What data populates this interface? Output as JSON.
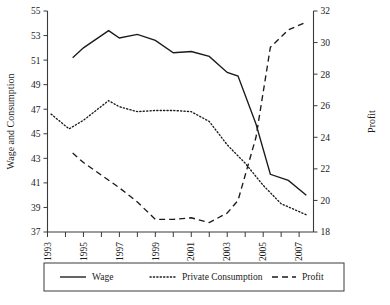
{
  "chart_data": {
    "type": "line",
    "title": "",
    "xlabel": "",
    "ylabel": "Wage and Consumption",
    "y2label": "Profit",
    "grid": false,
    "legend_position": "bottom",
    "x": [
      1993,
      1994,
      1995,
      1996,
      1997,
      1998,
      1999,
      2000,
      2001,
      2002,
      2003,
      2004,
      2005,
      2006,
      2007
    ],
    "xtick_labels": [
      "1993",
      "1995",
      "1997",
      "1999",
      "2001",
      "2003",
      "2005",
      "2007"
    ],
    "xtick_values": [
      1993,
      1995,
      1997,
      1999,
      2001,
      2003,
      2005,
      2007
    ],
    "xlim": [
      1993,
      2007.8
    ],
    "ylim": [
      37,
      55
    ],
    "ytick_values": [
      37,
      39,
      41,
      43,
      45,
      47,
      49,
      51,
      53,
      55
    ],
    "ytick_labels": [
      "37",
      "39",
      "41",
      "43",
      "45",
      "47",
      "49",
      "51",
      "53",
      "55"
    ],
    "y2lim": [
      18,
      32
    ],
    "y2tick_values": [
      18,
      20,
      22,
      24,
      26,
      28,
      30,
      32
    ],
    "y2tick_labels": [
      "18",
      "20",
      "22",
      "24",
      "26",
      "28",
      "30",
      "32"
    ],
    "series": [
      {
        "name": "Wage",
        "axis": "left",
        "style": "solid",
        "x": [
          1994.4,
          1995,
          1996.4,
          1997,
          1998,
          1999,
          2000,
          2001,
          2002,
          2003,
          2003.6,
          2004.6,
          2005.4,
          2006.4,
          2007.4
        ],
        "values": [
          51.2,
          52.0,
          53.4,
          52.8,
          53.1,
          52.6,
          51.6,
          51.7,
          51.3,
          50.0,
          49.7,
          45.8,
          41.7,
          41.2,
          40.0
        ]
      },
      {
        "name": "Private Consumption",
        "axis": "left",
        "style": "dotted",
        "x": [
          1993.2,
          1994.2,
          1995,
          1996.4,
          1997,
          1998,
          1999,
          2000,
          2001,
          2002,
          2003,
          2004,
          2005,
          2006,
          2007.4
        ],
        "values": [
          46.6,
          45.4,
          46.1,
          47.7,
          47.2,
          46.8,
          46.9,
          46.9,
          46.8,
          46.0,
          44.1,
          42.6,
          40.8,
          39.3,
          38.4
        ]
      },
      {
        "name": "Profit",
        "axis": "right",
        "style": "dashed",
        "x": [
          1994.4,
          1995,
          1996,
          1997,
          1998,
          1999,
          2000,
          2001,
          2002,
          2003,
          2003.6,
          2004.6,
          2005.4,
          2006.4,
          2007.4
        ],
        "values": [
          23.0,
          22.4,
          21.6,
          20.8,
          19.9,
          18.8,
          18.8,
          18.9,
          18.6,
          19.2,
          20.0,
          24.0,
          29.7,
          30.8,
          31.3
        ]
      }
    ],
    "legend": [
      {
        "label": "Wage",
        "style": "solid"
      },
      {
        "label": "Private Consumption",
        "style": "dotted"
      },
      {
        "label": "Profit",
        "style": "dashed"
      }
    ]
  }
}
